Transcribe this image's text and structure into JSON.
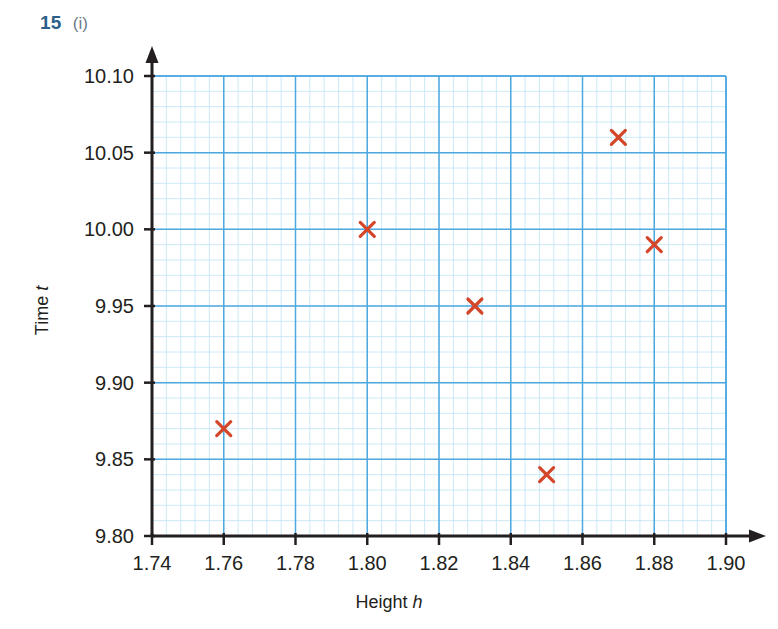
{
  "header": {
    "question_number": "15",
    "question_part": "(i)"
  },
  "chart_data": {
    "type": "scatter",
    "title": "",
    "xlabel": "Height h",
    "xlabel_text": "Height",
    "xlabel_symbol": "h",
    "ylabel": "Time t",
    "ylabel_text": "Time",
    "ylabel_symbol": "t",
    "xlim": [
      1.74,
      1.9
    ],
    "ylim": [
      9.8,
      10.1
    ],
    "xticks": [
      "1.74",
      "1.76",
      "1.78",
      "1.80",
      "1.82",
      "1.84",
      "1.86",
      "1.88",
      "1.90"
    ],
    "xtick_values": [
      1.74,
      1.76,
      1.78,
      1.8,
      1.82,
      1.84,
      1.86,
      1.88,
      1.9
    ],
    "yticks": [
      "9.80",
      "9.85",
      "9.90",
      "9.95",
      "10.00",
      "10.05",
      "10.10"
    ],
    "ytick_values": [
      9.8,
      9.85,
      9.9,
      9.95,
      10.0,
      10.05,
      10.1
    ],
    "x_major_step": 0.02,
    "y_major_step": 0.05,
    "x_minor_divisions": 5,
    "y_minor_divisions": 5,
    "grid": true,
    "legend": false,
    "marker": "x",
    "points": [
      {
        "x": 1.76,
        "y": 9.87
      },
      {
        "x": 1.8,
        "y": 10.0
      },
      {
        "x": 1.83,
        "y": 9.95
      },
      {
        "x": 1.85,
        "y": 9.84
      },
      {
        "x": 1.87,
        "y": 10.06
      },
      {
        "x": 1.88,
        "y": 9.99
      }
    ],
    "x": [
      1.76,
      1.8,
      1.83,
      1.85,
      1.87,
      1.88
    ],
    "values": [
      9.87,
      10.0,
      9.95,
      9.84,
      10.06,
      9.99
    ]
  },
  "colors": {
    "marker": "#d4462a",
    "major_grid": "#4ea8e0",
    "minor_grid": "#bfe3f5",
    "axis": "#231f20",
    "header_number": "#2c5f8a",
    "header_part": "#6b7c88",
    "label_text": "#231f20"
  }
}
